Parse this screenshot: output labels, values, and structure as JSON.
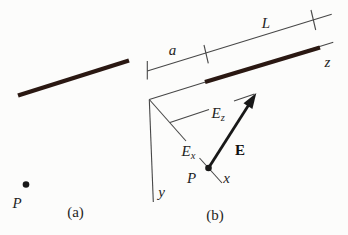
{
  "figure": {
    "panel_a": {
      "caption": "(a)",
      "point_label": "P"
    },
    "panel_b": {
      "caption": "(b)",
      "dim_a": "a",
      "dim_L": "L",
      "axis_z": "z",
      "axis_y": "y",
      "axis_x": "x",
      "point_label": "P",
      "vector_label": "E",
      "component_x": {
        "base": "E",
        "sub": "x"
      },
      "component_z": {
        "base": "E",
        "sub": "z"
      }
    },
    "colors": {
      "rod": "#2a1812",
      "line": "#474747",
      "ink": "#181818",
      "background": "#fcfcfb"
    }
  }
}
